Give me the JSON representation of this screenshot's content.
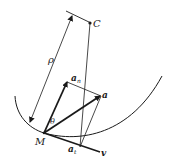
{
  "diagram": {
    "labels": {
      "center": "C",
      "radius": "ρ",
      "normal_accel": "a",
      "normal_sub": "n",
      "accel": "a",
      "angle": "θ",
      "point": "M",
      "tangential_accel": "a",
      "tangential_sub": "t",
      "velocity": "v"
    },
    "colors": {
      "stroke": "#1a1a1a",
      "background": "#ffffff"
    }
  }
}
